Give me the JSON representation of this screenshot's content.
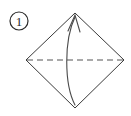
{
  "figure": {
    "kind": "origami-fold-instruction",
    "step_label": "1",
    "background_color": "#ffffff",
    "line_color": "#3a3a3a",
    "dashed_line_color": "#555555",
    "arrow_color": "#4a4a4a"
  },
  "step_badge": {
    "label": "1",
    "shape": "circle",
    "center_x": 19,
    "center_y": 21,
    "radius": 9
  },
  "shape": {
    "name": "square-rotated-45-diamond",
    "vertices": [
      {
        "name": "top",
        "x": 75,
        "y": 13
      },
      {
        "name": "right",
        "x": 124,
        "y": 60
      },
      {
        "name": "bottom",
        "x": 75,
        "y": 108
      },
      {
        "name": "left",
        "x": 26,
        "y": 60
      }
    ],
    "points_attr": "75,13 124,60 75,108 26,60"
  },
  "fold_line": {
    "name": "valley-fold-horizontal",
    "style": "dashed",
    "dash_pattern": "6,4",
    "x1": 27,
    "y1": 60,
    "x2": 123,
    "y2": 60
  },
  "fold_arrow": {
    "name": "fold-up-arrow",
    "from": {
      "x": 75,
      "y": 105
    },
    "to": {
      "x": 75,
      "y": 16
    },
    "path": "M 75 105 C 64 84, 64 40, 75 17",
    "head_path": "M 68 31 L 75 15 L 80 32",
    "direction": "bottom-to-top"
  }
}
